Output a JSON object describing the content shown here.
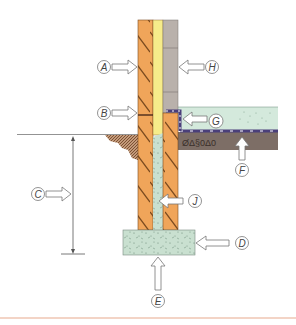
{
  "diagram": {
    "type": "wall-foundation-cross-section",
    "colors": {
      "brick": "#f0a55a",
      "brick_hatch": "#7a4a1e",
      "insulation": "#f6ec8a",
      "block": "#b9b1ab",
      "concrete": "#c9e0d0",
      "screed": "#d4e9dc",
      "hardcore": "#7d6e66",
      "dpm": "#4a3f7a",
      "soil": "#8a5a3a",
      "arrow_stroke": "#666666",
      "divider": "#e8a98e"
    },
    "labels": {
      "A": "A",
      "B": "B",
      "C": "C",
      "D": "D",
      "E": "E",
      "F": "F",
      "G": "G",
      "H": "H",
      "J": "J"
    }
  }
}
